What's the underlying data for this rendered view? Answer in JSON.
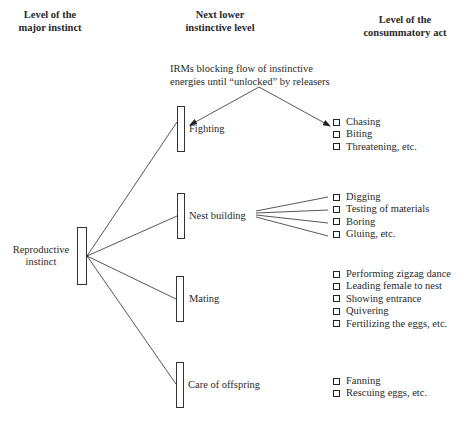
{
  "headers": {
    "major": [
      "Level of the",
      "major instinct"
    ],
    "lower": [
      "Next lower",
      "instinctive level"
    ],
    "consummatory": [
      "Level of the",
      "consummatory act"
    ]
  },
  "annotation": [
    "IRMs blocking flow of instinctive",
    "energies until “unlocked” by releasers"
  ],
  "major_instinct": {
    "label": [
      "Reproductive",
      "instinct"
    ]
  },
  "lower_levels": [
    {
      "label": "Fighting",
      "acts": [
        "Chasing",
        "Biting",
        "Threatening, etc."
      ]
    },
    {
      "label": "Nest building",
      "acts": [
        "Digging",
        "Testing of materials",
        "Boring",
        "Gluing, etc."
      ]
    },
    {
      "label": "Mating",
      "acts": [
        "Performing zigzag dance",
        "Leading female to nest",
        "Showing entrance",
        "Quivering",
        "Fertilizing the eggs, etc."
      ]
    },
    {
      "label": "Care of offspring",
      "acts": [
        "Fanning",
        "Rescuing eggs, etc."
      ]
    }
  ],
  "colors": {
    "line": "#333333",
    "text": "#2a2a2a",
    "background": "#ffffff"
  }
}
